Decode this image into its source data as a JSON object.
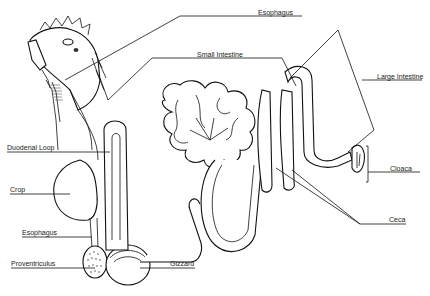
{
  "diagram": {
    "style": "black line drawing on white",
    "colors": {
      "line": "#111111",
      "background": "#ffffff",
      "text": "#222222"
    },
    "labels": [
      {
        "id": "esophagus_top",
        "text": "Esophagus",
        "x": 258,
        "y": 9
      },
      {
        "id": "small_intestine",
        "text": "Small Intestine",
        "x": 197,
        "y": 52
      },
      {
        "id": "large_intestine",
        "text": "Large Intestine",
        "x": 377,
        "y": 77
      },
      {
        "id": "duodenal_loop",
        "text": "Duodenal Loop",
        "x": 7,
        "y": 143
      },
      {
        "id": "crop",
        "text": "Crop",
        "x": 10,
        "y": 185
      },
      {
        "id": "cloaca",
        "text": "Cloaca",
        "x": 390,
        "y": 165
      },
      {
        "id": "ceca",
        "text": "Ceca",
        "x": 389,
        "y": 217
      },
      {
        "id": "esophagus_bottom",
        "text": "Esophagus",
        "x": 22,
        "y": 230
      },
      {
        "id": "proventriculus",
        "text": "Proventriculus",
        "x": 11,
        "y": 260
      },
      {
        "id": "gizzard",
        "text": "Gizzard",
        "x": 170,
        "y": 260
      }
    ]
  }
}
